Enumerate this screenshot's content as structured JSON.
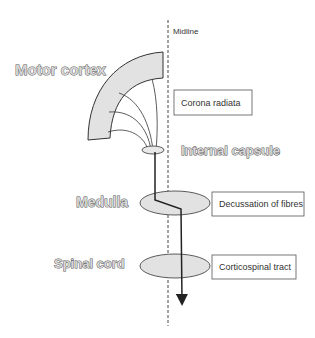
{
  "diagram": {
    "midline_label": "Midline",
    "regions": [
      {
        "id": "motor-cortex",
        "label": "Motor cortex"
      },
      {
        "id": "internal-capsule",
        "label": "Internal capsule"
      },
      {
        "id": "medulla",
        "label": "Medulla"
      },
      {
        "id": "spinal-cord",
        "label": "Spinal cord"
      }
    ],
    "boxes": [
      {
        "id": "corona-radiata",
        "label": "Corona radiata"
      },
      {
        "id": "decussation",
        "label": "Decussation of fibres"
      },
      {
        "id": "corticospinal-tract",
        "label": "Corticospinal tract"
      }
    ],
    "colors": {
      "stroke": "#333333",
      "fill": "#e2e2e2",
      "midline": "#444444"
    }
  }
}
